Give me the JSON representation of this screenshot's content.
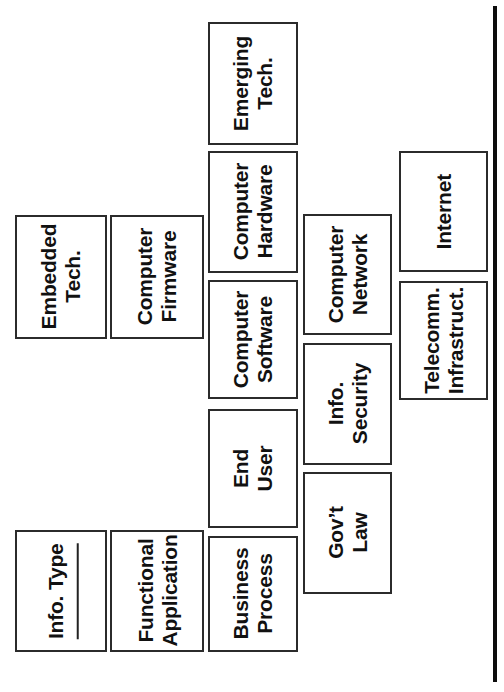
{
  "diagram": {
    "orientation": "rotated-90-ccw",
    "background_color": "#ffffff",
    "box_border_color": "#2b2b2b",
    "text_color": "#111111",
    "rule_color": "#0d0d0d",
    "nodes": [
      {
        "id": "info-type",
        "lines": [
          "Info. Type"
        ],
        "has_fill_in_rule": true,
        "x": 15,
        "y": 530,
        "w": 92,
        "h": 122
      },
      {
        "id": "functional-application",
        "lines": [
          "Functional",
          "Application"
        ],
        "has_fill_in_rule": false,
        "x": 110,
        "y": 530,
        "w": 94,
        "h": 122
      },
      {
        "id": "embedded-tech",
        "lines": [
          "Embedded",
          "Tech."
        ],
        "has_fill_in_rule": false,
        "x": 15,
        "y": 215,
        "w": 92,
        "h": 124
      },
      {
        "id": "computer-firmware",
        "lines": [
          "Computer",
          "Firmware"
        ],
        "has_fill_in_rule": false,
        "x": 110,
        "y": 215,
        "w": 94,
        "h": 124
      },
      {
        "id": "emerging-tech",
        "lines": [
          "Emerging",
          "Tech."
        ],
        "has_fill_in_rule": false,
        "x": 208,
        "y": 22,
        "w": 90,
        "h": 123
      },
      {
        "id": "computer-hardware",
        "lines": [
          "Computer",
          "Hardware"
        ],
        "has_fill_in_rule": false,
        "x": 208,
        "y": 151,
        "w": 90,
        "h": 122
      },
      {
        "id": "computer-software",
        "lines": [
          "Computer",
          "Software"
        ],
        "has_fill_in_rule": false,
        "x": 208,
        "y": 280,
        "w": 90,
        "h": 119
      },
      {
        "id": "end-user",
        "lines": [
          "End",
          "User"
        ],
        "has_fill_in_rule": false,
        "x": 208,
        "y": 409,
        "w": 90,
        "h": 119
      },
      {
        "id": "business-process",
        "lines": [
          "Business",
          "Process"
        ],
        "has_fill_in_rule": false,
        "x": 208,
        "y": 536,
        "w": 90,
        "h": 116
      },
      {
        "id": "computer-network",
        "lines": [
          "Computer",
          "Network"
        ],
        "has_fill_in_rule": false,
        "x": 303,
        "y": 214,
        "w": 89,
        "h": 121
      },
      {
        "id": "info-security",
        "lines": [
          "Info.",
          "Security"
        ],
        "has_fill_in_rule": false,
        "x": 303,
        "y": 343,
        "w": 89,
        "h": 122
      },
      {
        "id": "govt-law",
        "lines": [
          "Gov’t",
          "Law"
        ],
        "has_fill_in_rule": false,
        "x": 303,
        "y": 472,
        "w": 89,
        "h": 122
      },
      {
        "id": "internet",
        "lines": [
          "Internet"
        ],
        "has_fill_in_rule": false,
        "x": 399,
        "y": 151,
        "w": 89,
        "h": 121
      },
      {
        "id": "telecomm-infrastruct",
        "lines": [
          "Telecomm.",
          "Infrastruct."
        ],
        "has_fill_in_rule": false,
        "x": 399,
        "y": 281,
        "w": 89,
        "h": 119
      }
    ],
    "spine_rule": {
      "x": 493,
      "y": 6,
      "w": 4,
      "h": 676
    }
  }
}
